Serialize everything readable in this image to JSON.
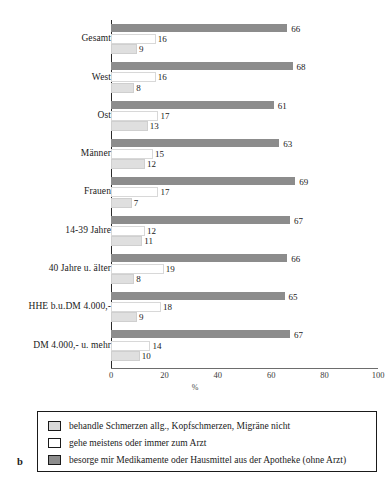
{
  "panel_letter": "b",
  "axis": {
    "x_title": "%",
    "ticks": [
      0,
      20,
      40,
      60,
      80,
      100
    ],
    "xlim_min": 0,
    "xlim_max": 100
  },
  "legend": {
    "entries": [
      {
        "key": "nicht_behandelt",
        "label": "behandle Schmerzen allg., Kopfschmerzen, Migräne nicht",
        "color": "#d9d9d9"
      },
      {
        "key": "arzt",
        "label": "gehe meistens oder immer zum Arzt",
        "color": "#ffffff"
      },
      {
        "key": "apotheke",
        "label": "besorge mir Medikamente oder Hausmittel aus der Apotheke (ohne Arzt)",
        "color": "#8c8c8c"
      }
    ]
  },
  "chart_data": {
    "type": "bar",
    "orientation": "horizontal",
    "title": "",
    "xlabel": "%",
    "ylabel": "",
    "xlim": [
      0,
      100
    ],
    "xticks": [
      0,
      20,
      40,
      60,
      80,
      100
    ],
    "grid": false,
    "legend_position": "bottom",
    "categories": [
      "Gesamt",
      "West",
      "Ost",
      "Männer",
      "Frauen",
      "14-39 Jahre",
      "40 Jahre u. älter",
      "HHE b.u.DM 4.000,-",
      "DM 4.000,- u. mehr"
    ],
    "series": [
      {
        "name": "besorge mir Medikamente oder Hausmittel aus der Apotheke (ohne Arzt)",
        "color": "#8c8c8c",
        "values": [
          66,
          68,
          61,
          63,
          69,
          67,
          66,
          65,
          67
        ]
      },
      {
        "name": "gehe meistens oder immer zum Arzt",
        "color": "#ffffff",
        "values": [
          16,
          16,
          17,
          15,
          17,
          12,
          19,
          18,
          14
        ]
      },
      {
        "name": "behandle Schmerzen allg., Kopfschmerzen, Migräne nicht",
        "color": "#d9d9d9",
        "values": [
          9,
          8,
          13,
          12,
          7,
          11,
          8,
          9,
          10
        ]
      }
    ]
  }
}
